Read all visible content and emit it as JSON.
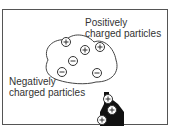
{
  "diagram": {
    "labels": {
      "positive_line1": "Positively",
      "positive_line2": "charged particles",
      "negative_line1": "Negatively",
      "negative_line2": "charged particles"
    },
    "cloud_particles": [
      {
        "sign": "+",
        "x": 66,
        "y": 42
      },
      {
        "sign": "+",
        "x": 85,
        "y": 50
      },
      {
        "sign": "+",
        "x": 100,
        "y": 47
      },
      {
        "sign": "−",
        "x": 73,
        "y": 61
      },
      {
        "sign": "−",
        "x": 62,
        "y": 72
      },
      {
        "sign": "−",
        "x": 97,
        "y": 73
      }
    ],
    "ground_particles": [
      {
        "sign": "+",
        "x": 108,
        "y": 99
      },
      {
        "sign": "+",
        "x": 112,
        "y": 110
      },
      {
        "sign": "+",
        "x": 102,
        "y": 120
      }
    ]
  }
}
